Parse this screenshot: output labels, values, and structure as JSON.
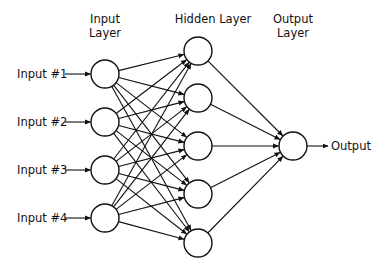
{
  "diagram": {
    "title_labels": {
      "input_layer": [
        "Input",
        "Layer"
      ],
      "hidden_layer": "Hidden Layer",
      "output_layer": [
        "Output",
        "Layer"
      ]
    },
    "inputs": [
      "Input #1",
      "Input #2",
      "Input #3",
      "Input #4"
    ],
    "output_label": "Output",
    "layers": {
      "input": {
        "x": 105,
        "ys": [
          74,
          122,
          170,
          218
        ]
      },
      "hidden": {
        "x": 198,
        "ys": [
          51,
          98,
          146,
          194,
          243
        ]
      },
      "output": {
        "x": 293,
        "ys": [
          146
        ]
      }
    },
    "node_radius": 14,
    "stroke_color": "#111111",
    "fill_color": "#ffffff"
  }
}
